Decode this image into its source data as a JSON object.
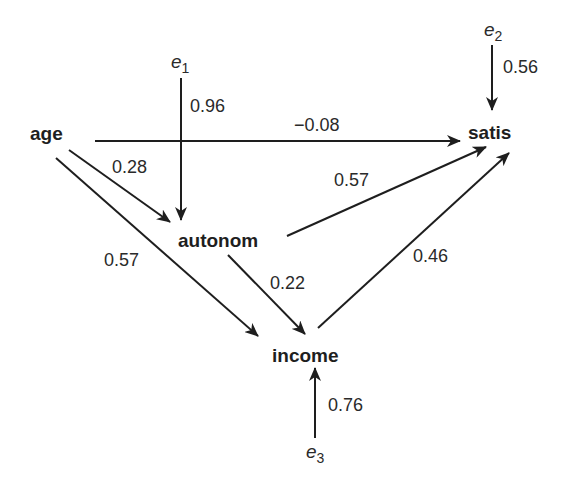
{
  "diagram": {
    "type": "path-diagram",
    "colors": {
      "line": "#1e1e1e",
      "text": "#2a2a2a",
      "background": "#ffffff"
    },
    "nodes": {
      "age": {
        "label": "age"
      },
      "autonom": {
        "label": "autonom"
      },
      "income": {
        "label": "income"
      },
      "satis": {
        "label": "satis"
      }
    },
    "errors": {
      "e1": {
        "base": "e",
        "sub": "1",
        "target": "autonom",
        "coef": "0.96"
      },
      "e2": {
        "base": "e",
        "sub": "2",
        "target": "satis",
        "coef": "0.56"
      },
      "e3": {
        "base": "e",
        "sub": "3",
        "target": "income",
        "coef": "0.76"
      }
    },
    "edges": {
      "age_satis": {
        "from": "age",
        "to": "satis",
        "coef": "−0.08"
      },
      "age_autonom": {
        "from": "age",
        "to": "autonom",
        "coef": "0.28"
      },
      "age_income": {
        "from": "age",
        "to": "income",
        "coef": "0.57"
      },
      "autonom_satis": {
        "from": "autonom",
        "to": "satis",
        "coef": "0.57"
      },
      "autonom_income": {
        "from": "autonom",
        "to": "income",
        "coef": "0.22"
      },
      "income_satis": {
        "from": "income",
        "to": "satis",
        "coef": "0.46"
      }
    }
  }
}
